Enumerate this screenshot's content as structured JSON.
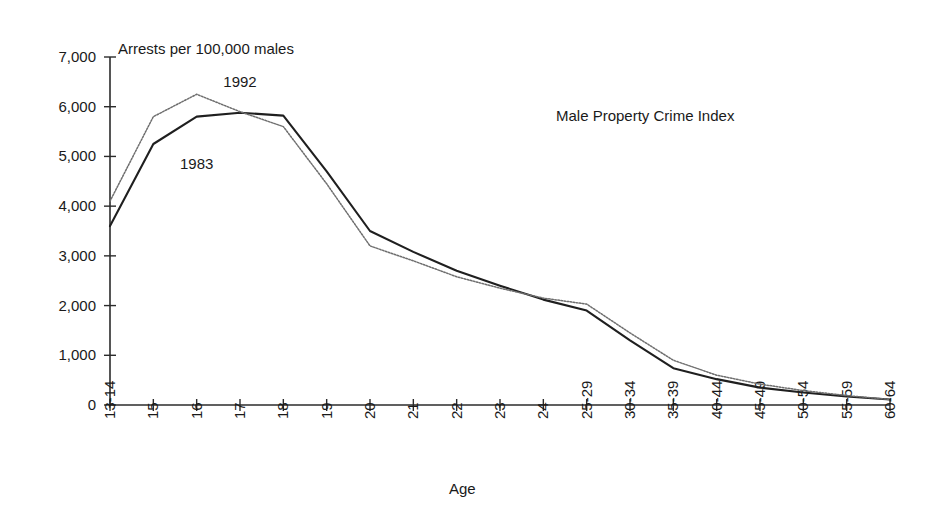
{
  "chart_data": {
    "type": "line",
    "title": "Male Property Crime Index",
    "ylabel": "Arrests per 100,000 males",
    "xlabel": "Age",
    "grid": false,
    "legend_position": "inline-annotation",
    "ylim": [
      0,
      7000
    ],
    "ytick_values": [
      0,
      1000,
      2000,
      3000,
      4000,
      5000,
      6000,
      7000
    ],
    "ytick_labels": [
      "0",
      "1,000",
      "2,000",
      "3,000",
      "4,000",
      "5,000",
      "6,000",
      "7,000"
    ],
    "categories": [
      "13-14",
      "15",
      "16",
      "17",
      "18",
      "19",
      "20",
      "21",
      "22",
      "23",
      "24",
      "25-29",
      "30-34",
      "35-39",
      "40-44",
      "45-49",
      "50-54",
      "55-59",
      "60-64"
    ],
    "series": [
      {
        "name": "1983",
        "style": "solid",
        "color": "#1f1f1f",
        "values": [
          3600,
          5250,
          5800,
          5880,
          5820,
          4700,
          3500,
          3080,
          2700,
          2400,
          2120,
          1900,
          1300,
          740,
          520,
          350,
          250,
          170,
          110
        ]
      },
      {
        "name": "1992",
        "style": "dotted",
        "color": "#6e6e6e",
        "values": [
          4100,
          5800,
          6250,
          5900,
          5600,
          4450,
          3200,
          2900,
          2580,
          2350,
          2150,
          2030,
          1450,
          900,
          600,
          420,
          290,
          190,
          110
        ]
      }
    ],
    "annotations": [
      {
        "text": "1992",
        "x_category": "17",
        "y_value": 6400
      },
      {
        "text": "1983",
        "x_category": "16",
        "y_value": 4750
      }
    ]
  }
}
